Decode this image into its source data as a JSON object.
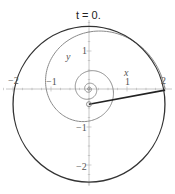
{
  "title": "t = 0.",
  "axes": {
    "x_label": "x",
    "y_label": "y",
    "x_ticks": [
      "−2",
      "−1",
      "1",
      "2"
    ],
    "y_ticks": [
      "1",
      "−1",
      "−2"
    ]
  },
  "colors": {
    "axis": "#b0b0b0",
    "spiral": "#8a8a8a",
    "circle": "#333333",
    "segment": "#222222",
    "marker": "#777777"
  },
  "chart_data": {
    "type": "diagram",
    "title": "t = 0.",
    "xlabel": "x",
    "ylabel": "y",
    "xlim": [
      -2.3,
      2.2
    ],
    "ylim": [
      -2.5,
      2.4
    ],
    "origin_px": [
      89,
      89
    ],
    "unit_px": 38,
    "spiral": {
      "kind": "logarithmic",
      "center": [
        0,
        0
      ],
      "outer_radius": 2.0,
      "decay_per_quarter_turn": 0.75,
      "turns": 4.2
    },
    "circle": {
      "center": [
        0,
        -0.4
      ],
      "radius": 2.05
    },
    "segment": {
      "from": [
        0,
        -0.4
      ],
      "to": [
        2.0,
        -0.03
      ]
    },
    "marker": {
      "at": [
        0,
        -0.4
      ],
      "radius_px": 2.5
    }
  }
}
